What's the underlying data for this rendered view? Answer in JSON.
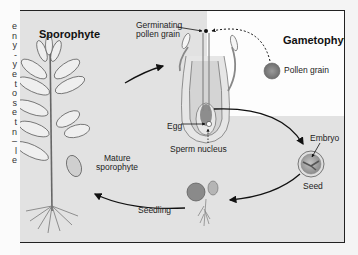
{
  "page_fragment": {
    "chars": [
      "e",
      "n",
      "y",
      "-",
      "y",
      "e",
      "t",
      "o",
      "s",
      "e",
      "t",
      "n",
      "–",
      "l",
      "e"
    ]
  },
  "diagram": {
    "titles": {
      "sporophyte": "Sporophyte",
      "gametophyte": "Gametophyte"
    },
    "labels": {
      "germinating_pollen_grain_1": "Germinating",
      "germinating_pollen_grain_2": "pollen grain",
      "pollen_grain": "Pollen grain",
      "egg": "Egg",
      "sperm_nucleus": "Sperm nucleus",
      "embryo": "Embryo",
      "seed": "Seed",
      "seedling": "Seedling",
      "mature_sporophyte_1": "Mature",
      "mature_sporophyte_2": "sporophyte"
    },
    "colors": {
      "background_gray": "#e2e2e2",
      "panel_white": "#fdfdfd",
      "line": "#111111",
      "pollen_fill": "#8a8a8a"
    }
  }
}
